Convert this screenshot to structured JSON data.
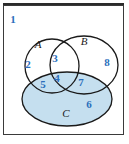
{
  "figure": {
    "background_color": "#ffffff",
    "frame_color": "#3a3a3a",
    "outline_color": "#1a1a1a",
    "number_color": "#2a6ebb",
    "set_label_color": "#1a1a1a",
    "shaded_fill_color": "#c5dfef"
  },
  "sets": [
    {
      "id": "A",
      "label": "A",
      "shape": "circle",
      "filled": false,
      "cx": 52,
      "cy": 66,
      "rx": 27,
      "ry": 27,
      "label_x": 38,
      "label_y": 44
    },
    {
      "id": "B",
      "label": "B",
      "shape": "ellipse",
      "filled": false,
      "cx": 84,
      "cy": 65,
      "rx": 34,
      "ry": 29,
      "label_x": 84,
      "label_y": 41
    },
    {
      "id": "C",
      "label": "C",
      "shape": "ellipse",
      "filled": true,
      "cx": 67,
      "cy": 99,
      "rx": 45,
      "ry": 27,
      "label_x": 66,
      "label_y": 113
    }
  ],
  "regions": [
    {
      "number": "1",
      "meaning": "outside A, B and C (universal set)",
      "x": 13,
      "y": 19
    },
    {
      "number": "2",
      "meaning": "A only",
      "x": 28,
      "y": 64
    },
    {
      "number": "3",
      "meaning": "A intersect B, not C",
      "x": 55,
      "y": 58
    },
    {
      "number": "4",
      "meaning": "A intersect B intersect C",
      "x": 57,
      "y": 78
    },
    {
      "number": "5",
      "meaning": "A intersect C, not B",
      "x": 43,
      "y": 84
    },
    {
      "number": "6",
      "meaning": "C only",
      "x": 89,
      "y": 104
    },
    {
      "number": "7",
      "meaning": "B intersect C, not A",
      "x": 81,
      "y": 82
    },
    {
      "number": "8",
      "meaning": "B only",
      "x": 107,
      "y": 62
    }
  ]
}
